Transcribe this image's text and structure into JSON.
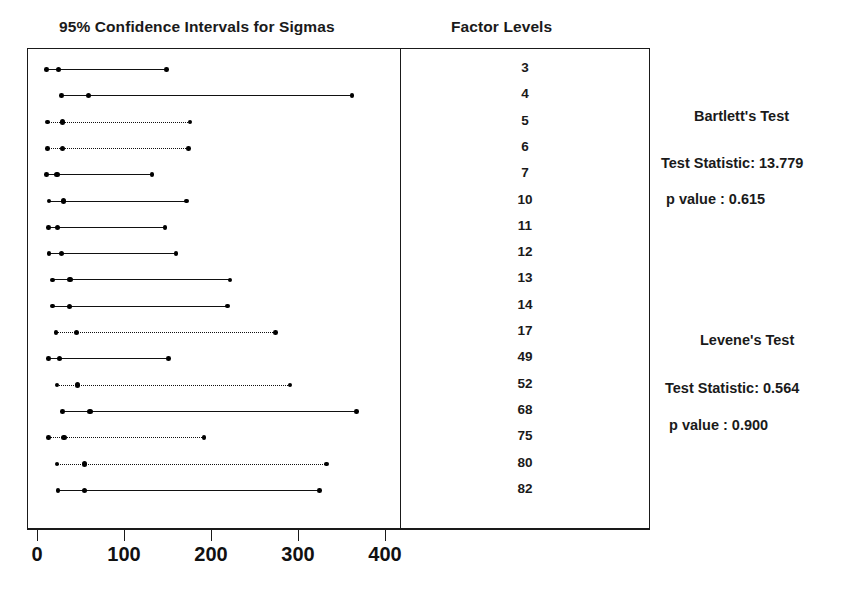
{
  "plot": {
    "title": "95% Confidence Intervals for Sigmas",
    "levels_column_title": "Factor Levels"
  },
  "axis": {
    "ticks": [
      0,
      100,
      200,
      300,
      400
    ],
    "tick_labels": [
      "0",
      "100",
      "200",
      "300",
      "400"
    ],
    "min": 0,
    "max": 430
  },
  "tests": {
    "bartlett": {
      "name": "Bartlett's Test",
      "statistic_label": "Test Statistic: 13.779",
      "p_value_label": "p value :  0.615",
      "statistic": 13.779,
      "p_value": 0.615
    },
    "levene": {
      "name": "Levene's Test",
      "statistic_label": "Test Statistic: 0.564",
      "p_value_label": "p value : 0.900",
      "statistic": 0.564,
      "p_value": 0.9
    }
  },
  "chart_data": {
    "type": "line",
    "title": "95% Confidence Intervals for Sigmas",
    "xlabel": "",
    "ylabel": "Factor Levels",
    "xlim": [
      0,
      430
    ],
    "grid": false,
    "legend": "none",
    "categories": [
      "3",
      "4",
      "5",
      "6",
      "7",
      "10",
      "11",
      "12",
      "13",
      "14",
      "17",
      "49",
      "52",
      "68",
      "75",
      "80",
      "82"
    ],
    "series": [
      {
        "name": "95% CI for sigma",
        "points": [
          {
            "level": "3",
            "lower": 11,
            "center": 25,
            "upper": 149,
            "style": "solid"
          },
          {
            "level": "4",
            "lower": 28,
            "center": 59,
            "upper": 362,
            "style": "solid"
          },
          {
            "level": "5",
            "lower": 12,
            "center": 29,
            "upper": 176,
            "style": "dotted"
          },
          {
            "level": "6",
            "lower": 12,
            "center": 29,
            "upper": 174,
            "style": "dotted"
          },
          {
            "level": "7",
            "lower": 11,
            "center": 23,
            "upper": 132,
            "style": "solid"
          },
          {
            "level": "10",
            "lower": 14,
            "center": 30,
            "upper": 172,
            "style": "solid"
          },
          {
            "level": "11",
            "lower": 13,
            "center": 24,
            "upper": 147,
            "style": "solid"
          },
          {
            "level": "12",
            "lower": 14,
            "center": 28,
            "upper": 160,
            "style": "solid"
          },
          {
            "level": "13",
            "lower": 18,
            "center": 38,
            "upper": 222,
            "style": "solid"
          },
          {
            "level": "14",
            "lower": 18,
            "center": 37,
            "upper": 219,
            "style": "solid"
          },
          {
            "level": "17",
            "lower": 22,
            "center": 45,
            "upper": 274,
            "style": "dotted"
          },
          {
            "level": "49",
            "lower": 13,
            "center": 26,
            "upper": 151,
            "style": "solid"
          },
          {
            "level": "52",
            "lower": 23,
            "center": 47,
            "upper": 291,
            "style": "dotted"
          },
          {
            "level": "68",
            "lower": 29,
            "center": 61,
            "upper": 367,
            "style": "solid"
          },
          {
            "level": "75",
            "lower": 13,
            "center": 31,
            "upper": 192,
            "style": "dotted"
          },
          {
            "level": "80",
            "lower": 23,
            "center": 55,
            "upper": 333,
            "style": "dotted"
          },
          {
            "level": "82",
            "lower": 24,
            "center": 55,
            "upper": 325,
            "style": "solid"
          }
        ]
      }
    ],
    "annotations": [
      "Bartlett's Test",
      "Test Statistic: 13.779",
      "p value :  0.615",
      "Levene's Test",
      "Test Statistic: 0.564",
      "p value : 0.900"
    ]
  }
}
